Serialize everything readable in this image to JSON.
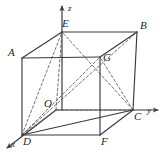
{
  "figure": {
    "kind": "3d-cube-coordinate-diagram",
    "stroke_color": "#3a3a42",
    "dash_color": "#5a5a63",
    "background": "#ffffff",
    "axes": [
      {
        "id": "z",
        "label": "z",
        "label_x": 68,
        "label_y": 4,
        "from": [
          62,
          110
        ],
        "to": [
          62,
          6
        ]
      },
      {
        "id": "y",
        "label": "y",
        "label_x": 147,
        "label_y": 106,
        "from": [
          56,
          110
        ],
        "to": [
          158,
          110
        ]
      },
      {
        "id": "x",
        "label": "x",
        "label_x": 11,
        "label_y": 140,
        "from": [
          56,
          110
        ],
        "to": [
          7,
          148
        ]
      }
    ],
    "vertices": [
      {
        "id": "A",
        "label": "A",
        "x": 22,
        "y": 58,
        "label_x": 8,
        "label_y": 47
      },
      {
        "id": "B",
        "label": "B",
        "x": 137,
        "y": 32,
        "label_x": 140,
        "label_y": 20
      },
      {
        "id": "C",
        "label": "C",
        "x": 133,
        "y": 110,
        "label_x": 134,
        "label_y": 111
      },
      {
        "id": "D",
        "label": "D",
        "x": 22,
        "y": 135,
        "label_x": 23,
        "label_y": 136
      },
      {
        "id": "E",
        "label": "E",
        "x": 62,
        "y": 32,
        "label_x": 62,
        "label_y": 18
      },
      {
        "id": "F",
        "label": "F",
        "x": 100,
        "y": 135,
        "label_x": 101,
        "label_y": 136
      },
      {
        "id": "G",
        "label": "G",
        "x": 100,
        "y": 57,
        "label_x": 103,
        "label_y": 52
      },
      {
        "id": "O",
        "label": "O",
        "x": 56,
        "y": 110,
        "label_x": 44,
        "label_y": 98
      }
    ],
    "solid_edges": [
      {
        "name": "edge-A-E",
        "from": "A",
        "to": "E"
      },
      {
        "name": "edge-E-B",
        "from": "E",
        "to": "B"
      },
      {
        "name": "edge-A-G",
        "from": "A",
        "to": "G"
      },
      {
        "name": "edge-G-B",
        "from": "G",
        "to": "B"
      },
      {
        "name": "edge-A-D",
        "from": "A",
        "to": "D"
      },
      {
        "name": "edge-G-F",
        "from": "G",
        "to": "F"
      },
      {
        "name": "edge-D-F",
        "from": "D",
        "to": "F"
      },
      {
        "name": "edge-B-C",
        "from": "B",
        "to": "C"
      },
      {
        "name": "edge-F-C",
        "from": "F",
        "to": "C"
      },
      {
        "name": "edge-D-C",
        "from": "D",
        "to": "C"
      }
    ],
    "dashed_edges": [
      {
        "name": "edge-O-E",
        "from": "O",
        "to": "E"
      },
      {
        "name": "edge-O-C",
        "from": "O",
        "to": "C"
      },
      {
        "name": "edge-O-D",
        "from": "O",
        "to": "D"
      },
      {
        "name": "diagonal-D-E",
        "from": "D",
        "to": "E"
      },
      {
        "name": "diagonal-D-G",
        "from": "D",
        "to": "G"
      },
      {
        "name": "diagonal-D-B",
        "from": "D",
        "to": "B"
      },
      {
        "name": "diagonal-C-E",
        "from": "C",
        "to": "E"
      },
      {
        "name": "diagonal-C-G",
        "from": "C",
        "to": "G"
      }
    ]
  }
}
